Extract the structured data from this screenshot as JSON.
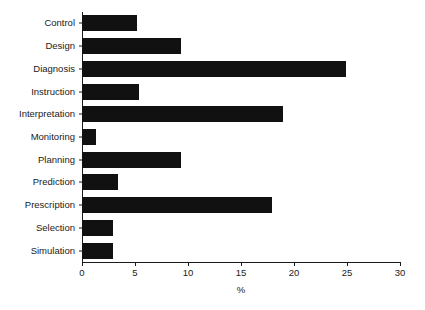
{
  "chart_data": {
    "type": "bar",
    "orientation": "horizontal",
    "title": "",
    "xlabel": "%",
    "ylabel": "",
    "xlim": [
      0,
      30
    ],
    "xticks": [
      0,
      5,
      10,
      15,
      20,
      25,
      30
    ],
    "xtick_labels": [
      "0",
      "5",
      "10",
      "15",
      "20",
      "25",
      "30"
    ],
    "grid": false,
    "legend": null,
    "bar_color": "#111111",
    "axis_color": "#1a1a1a",
    "categories": [
      "Control",
      "Design",
      "Diagnosis",
      "Instruction",
      "Interpretation",
      "Monitoring",
      "Planning",
      "Prediction",
      "Prescription",
      "Selection",
      "Simulation"
    ],
    "values": [
      5.2,
      9.3,
      24.9,
      5.4,
      19.0,
      1.3,
      9.3,
      3.4,
      17.9,
      2.9,
      2.9
    ]
  }
}
